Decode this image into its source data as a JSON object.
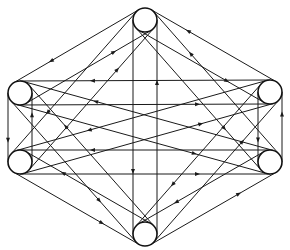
{
  "diagram": {
    "type": "complete-directed-graph",
    "colors": {
      "line": "#1a1a1a",
      "node_stroke": "#111111",
      "background": "#ffffff"
    },
    "node_radius": 12,
    "nodes": [
      {
        "id": "top",
        "x": 145,
        "y": 20
      },
      {
        "id": "upper-right",
        "x": 270,
        "y": 92
      },
      {
        "id": "lower-right",
        "x": 270,
        "y": 162
      },
      {
        "id": "bottom",
        "x": 145,
        "y": 234
      },
      {
        "id": "lower-left",
        "x": 20,
        "y": 162
      },
      {
        "id": "upper-left",
        "x": 20,
        "y": 93
      }
    ],
    "edges": "all ordered pairs (bidirectional, each pair drawn as two parallel tangent lines with opposite arrowheads)"
  }
}
